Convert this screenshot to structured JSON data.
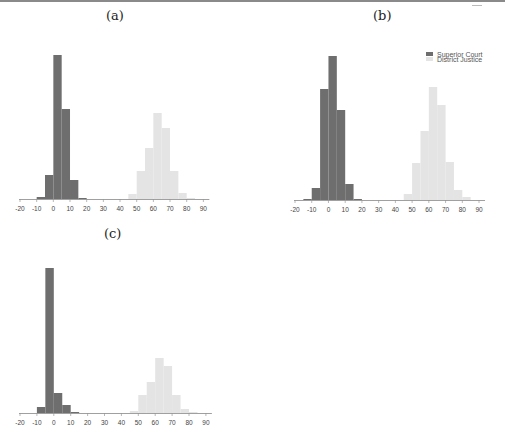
{
  "chart_data": [
    {
      "type": "bar",
      "subtype": "histogram",
      "panel": "(a)",
      "title": "(a)",
      "xlabel": "",
      "ylabel": "",
      "xlim": [
        -20,
        90
      ],
      "xticks": [
        -20,
        -10,
        0,
        10,
        20,
        30,
        40,
        50,
        60,
        70,
        80,
        90
      ],
      "grid": false,
      "bin_width": 5,
      "series": [
        {
          "name": "Superior Court",
          "color": "#6e6e6e",
          "bins": [
            -10,
            -5,
            0,
            5,
            10,
            15
          ],
          "values": [
            2,
            24,
            144,
            90,
            19,
            1
          ]
        },
        {
          "name": "District Justice",
          "color": "#e4e4e4",
          "bins": [
            45,
            50,
            55,
            60,
            65,
            70,
            75,
            80
          ],
          "values": [
            5,
            28,
            51,
            86,
            71,
            28,
            6,
            1
          ]
        }
      ]
    },
    {
      "type": "bar",
      "subtype": "histogram",
      "panel": "(b)",
      "title": "(b)",
      "xlabel": "",
      "ylabel": "",
      "xlim": [
        -20,
        90
      ],
      "xticks": [
        -20,
        -10,
        0,
        10,
        20,
        30,
        40,
        50,
        60,
        70,
        80,
        90
      ],
      "grid": false,
      "bin_width": 5,
      "legend": {
        "position": "upper right",
        "entries": [
          "Superior Court",
          "District Justice"
        ]
      },
      "series": [
        {
          "name": "Superior Court",
          "color": "#6e6e6e",
          "bins": [
            -15,
            -10,
            -5,
            0,
            5,
            10,
            15
          ],
          "values": [
            1,
            12,
            111,
            144,
            90,
            16,
            1
          ]
        },
        {
          "name": "District Justice",
          "color": "#e4e4e4",
          "bins": [
            45,
            50,
            55,
            60,
            65,
            70,
            75,
            80
          ],
          "values": [
            6,
            37,
            69,
            113,
            95,
            38,
            10,
            3
          ]
        }
      ]
    },
    {
      "type": "bar",
      "subtype": "histogram",
      "panel": "(c)",
      "title": "(c)",
      "xlabel": "",
      "ylabel": "",
      "xlim": [
        -20,
        90
      ],
      "xticks": [
        -20,
        -10,
        0,
        10,
        20,
        30,
        40,
        50,
        60,
        70,
        80,
        90
      ],
      "grid": false,
      "bin_width": 5,
      "series": [
        {
          "name": "Superior Court",
          "color": "#6e6e6e",
          "bins": [
            -10,
            -5,
            0,
            5,
            10
          ],
          "values": [
            6,
            145,
            20,
            8,
            1
          ]
        },
        {
          "name": "District Justice",
          "color": "#e4e4e4",
          "bins": [
            45,
            50,
            55,
            60,
            65,
            70,
            75,
            80
          ],
          "values": [
            2,
            18,
            31,
            55,
            47,
            18,
            4,
            1
          ]
        }
      ]
    }
  ],
  "panels": [
    {
      "label": "(a)",
      "x": 20,
      "baseline": 199,
      "px_per_unit": 1.667,
      "label_x": 112,
      "label_y": 8,
      "legend": false
    },
    {
      "label": "(b)",
      "x": 295,
      "baseline": 200,
      "px_per_unit": 1.673,
      "label_x": 379,
      "label_y": 8,
      "legend": true
    },
    {
      "label": "(c)",
      "x": 20,
      "baseline": 413,
      "px_per_unit": 1.69,
      "label_x": 104,
      "label_y": 224,
      "legend": false
    }
  ],
  "legend": {
    "entries": [
      {
        "label": "Superior Court",
        "color": "#6e6e6e"
      },
      {
        "label": "District Justice",
        "color": "#e4e4e4"
      }
    ]
  },
  "colors": {
    "dark": "#6e6e6e",
    "light": "#e4e4e4",
    "axis": "#888888",
    "text": "#444444"
  }
}
